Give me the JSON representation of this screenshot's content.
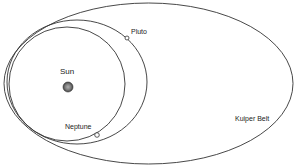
{
  "diagram": {
    "title": "",
    "labels": {
      "sun": "Sun",
      "pluto": "Pluto",
      "neptune": "Neptune",
      "kuiper_belt": "Kuiper Belt"
    },
    "colors": {
      "stroke": "#333333",
      "sun_fill": "#777777",
      "sun_highlight": "#aaaaaa",
      "background": "#ffffff"
    },
    "orbits": [
      {
        "name": "Neptune orbit",
        "cx": 67,
        "cy": 84,
        "rx": 58,
        "ry": 57
      },
      {
        "name": "Pluto orbit",
        "cx": 77,
        "cy": 82,
        "rx": 70,
        "ry": 62
      },
      {
        "name": "Kuiper Belt",
        "cx": 148.5,
        "cy": 83.5,
        "rx": 144.5,
        "ry": 80.5
      }
    ],
    "bodies": [
      {
        "name": "Sun",
        "x": 68,
        "y": 87,
        "r": 5
      },
      {
        "name": "Pluto",
        "x": 127,
        "y": 38,
        "r": 2
      },
      {
        "name": "Neptune",
        "x": 97,
        "y": 135,
        "r": 2.3
      }
    ]
  }
}
